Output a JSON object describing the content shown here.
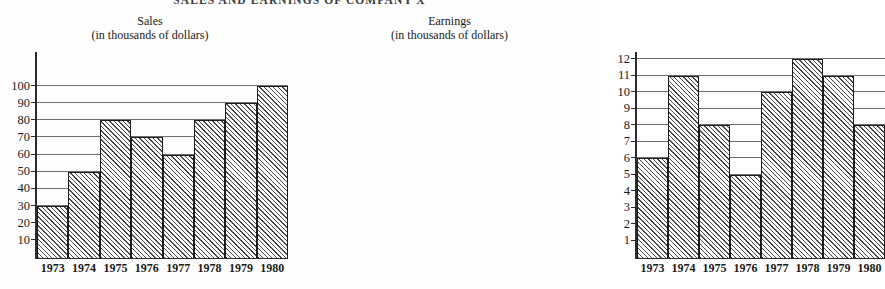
{
  "page": {
    "title": "SALES AND EARNINGS OF COMPANY X"
  },
  "charts": [
    {
      "id": "sales",
      "title": "Sales",
      "subtitle": "(in thousands of dollars)"
    },
    {
      "id": "earnings",
      "title": "Earnings",
      "subtitle": "(in thousands of dollars)"
    }
  ],
  "chart_data": [
    {
      "type": "bar",
      "title": "Sales",
      "subtitle": "(in thousands of dollars)",
      "xlabel": "",
      "ylabel": "",
      "categories": [
        "1973",
        "1974",
        "1975",
        "1976",
        "1977",
        "1978",
        "1979",
        "1980"
      ],
      "values": [
        30,
        50,
        80,
        70,
        60,
        80,
        90,
        100
      ],
      "yticks": [
        10,
        20,
        30,
        40,
        50,
        60,
        70,
        80,
        90,
        100
      ],
      "ylim": [
        0,
        100
      ],
      "grid": true,
      "legend": "none",
      "bar_fill": "diagonal-hatch",
      "colors": {
        "bar_edge": "#1b1b1b",
        "bar_hatch": "#4a4a4a",
        "axis": "#2b2b2b",
        "gridline": "#6e6e6e",
        "background": "#ffffff"
      }
    },
    {
      "type": "bar",
      "title": "Earnings",
      "subtitle": "(in thousands of dollars)",
      "xlabel": "",
      "ylabel": "",
      "categories": [
        "1973",
        "1974",
        "1975",
        "1976",
        "1977",
        "1978",
        "1979",
        "1980"
      ],
      "values": [
        6,
        11,
        8,
        5,
        10,
        12,
        11,
        8
      ],
      "yticks": [
        1,
        2,
        3,
        4,
        5,
        6,
        7,
        8,
        9,
        10,
        11,
        12
      ],
      "ylim": [
        0,
        12
      ],
      "grid": true,
      "legend": "none",
      "bar_fill": "diagonal-hatch",
      "colors": {
        "bar_edge": "#1b1b1b",
        "bar_hatch": "#4a4a4a",
        "axis": "#2b2b2b",
        "gridline": "#6e6e6e",
        "background": "#ffffff"
      }
    }
  ]
}
